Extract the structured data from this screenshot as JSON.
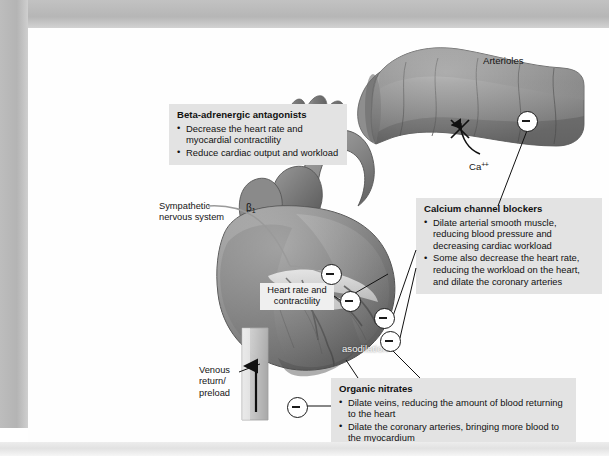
{
  "figure": {
    "kind": "medical-pharmacology-diagram"
  },
  "arteriole": {
    "title": "Arterioles",
    "calcium_label": "Ca",
    "calcium_charge": "++"
  },
  "heart": {
    "sympathetic_label": "Sympathetic\nnervous system",
    "beta1_label": "β",
    "beta1_sub": "1",
    "heart_rate_label": "Heart rate\nand\ncontractility",
    "vasodilation_label": "asodilation",
    "venous_label": "Venous\nreturn/\npreload"
  },
  "callouts": [
    {
      "id": "beta-adrenergic-antagonists",
      "title": "Beta-adrenergic antagonists",
      "bullets": [
        "Decrease the heart rate and myocardial contractility",
        "Reduce cardiac output and workload"
      ]
    },
    {
      "id": "calcium-channel-blockers",
      "title": "Calcium channel blockers",
      "bullets": [
        "Dilate arterial smooth muscle, reducing blood pressure and decreasing cardiac workload",
        "Some also decrease the heart rate, reducing the workload on the heart, and dilate the coronary arteries"
      ]
    },
    {
      "id": "organic-nitrates",
      "title": "Organic nitrates",
      "bullets": [
        "Dilate veins, reducing the amount of blood returning to the heart",
        "Dilate the coronary arteries, bringing more blood to the myocardium"
      ]
    }
  ],
  "symbols": {
    "inhibition_marker": "minus-circle",
    "blocked_marker": "x-cross",
    "count_minus_circles": 6
  },
  "colors": {
    "callout_bg": "#e3e3e3",
    "label_bg": "#efefef",
    "page_bg": "#fefefe",
    "frame": "#b8b8b8",
    "ink": "#111111",
    "heart_mid": "#8d8d8d"
  }
}
